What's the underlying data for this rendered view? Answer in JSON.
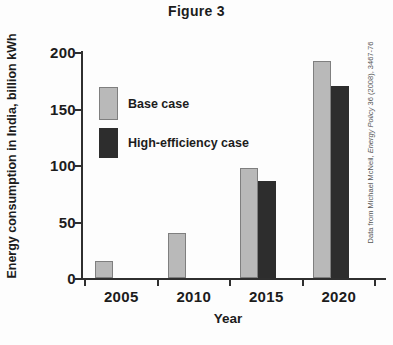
{
  "figure": {
    "credit": {
      "prefix": "Data from Michael McNeil, ",
      "journal": "Energy Policy",
      "suffix": " 36 (2008), 3467-76"
    }
  },
  "chart_data": {
    "type": "bar",
    "title": "Figure 3",
    "xlabel": "Year",
    "ylabel": "Energy consumption in India, billion kWh",
    "categories": [
      "2005",
      "2010",
      "2015",
      "2020"
    ],
    "series": [
      {
        "name": "Base case",
        "color": "#b9b9b9",
        "border_color": "#7f7f7f",
        "values": [
          15,
          40,
          97,
          192
        ]
      },
      {
        "name": "High-efficiency case",
        "color": "#2d2d2d",
        "border_color": "#2d2d2d",
        "values": [
          null,
          null,
          86,
          170
        ]
      }
    ],
    "ylim": [
      0,
      200
    ],
    "yticks": [
      0,
      50,
      100,
      150,
      200
    ],
    "grid": false,
    "legend_position": "upper-left-inside",
    "xtick_style": "between-categories"
  }
}
